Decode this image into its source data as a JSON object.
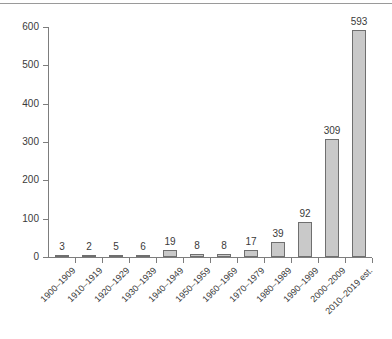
{
  "chart_data": {
    "type": "bar",
    "title": "",
    "subtitle": "",
    "xlabel": "",
    "ylabel": "",
    "categories": [
      "1900–1909",
      "1910–1919",
      "1920–1929",
      "1930–1939",
      "1940–1949",
      "1950–1959",
      "1960–1969",
      "1970–1979",
      "1980–1989",
      "1990–1999",
      "2000–2009",
      "2010–2019 est."
    ],
    "values": [
      3,
      2,
      5,
      6,
      19,
      8,
      8,
      17,
      39,
      92,
      309,
      593
    ],
    "data_labels": [
      "3",
      "2",
      "5",
      "6",
      "19",
      "8",
      "8",
      "17",
      "39",
      "92",
      "309",
      "593"
    ],
    "ylim": [
      0,
      600
    ],
    "ytick_values": [
      0,
      100,
      200,
      300,
      400,
      500,
      600
    ],
    "ytick_labels": [
      "0",
      "100",
      "200",
      "300",
      "400",
      "500",
      "600"
    ],
    "grid": false,
    "legend": null,
    "legend_position": "none",
    "bar_color": "#c9c9c9",
    "bar_border_color": "#6f6f6f",
    "axis_color": "#7d7d7d",
    "text_color": "#3a3a3a",
    "background_color": "#ffffff"
  }
}
